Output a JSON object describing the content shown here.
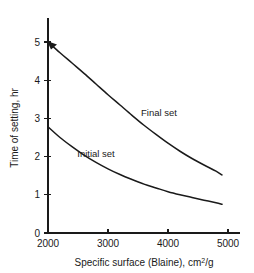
{
  "chart_data": {
    "type": "line",
    "title": "",
    "xlabel": "Specific surface (Blaine), cm²/g",
    "ylabel": "Time of setting, hr",
    "xlim": [
      2000,
      5000
    ],
    "ylim": [
      0,
      5
    ],
    "xticks": [
      2000,
      3000,
      4000,
      5000
    ],
    "xtick_labels": [
      "2000",
      "3000",
      "4000",
      "5000"
    ],
    "yticks": [
      0,
      1,
      2,
      3,
      4,
      5
    ],
    "ytick_labels": [
      "0",
      "1",
      "2",
      "3",
      "4",
      "5"
    ],
    "grid": false,
    "legend_position": "inline-annotations",
    "series": [
      {
        "name": "Final set",
        "label": "Final set",
        "label_x": 3850,
        "label_y": 3.05,
        "x": [
          2000,
          2200,
          2400,
          2600,
          2800,
          3000,
          3200,
          3400,
          3600,
          3800,
          4000,
          4200,
          4400,
          4600,
          4800,
          4900
        ],
        "y": [
          5.0,
          4.72,
          4.45,
          4.18,
          3.9,
          3.62,
          3.35,
          3.08,
          2.82,
          2.58,
          2.35,
          2.14,
          1.95,
          1.78,
          1.62,
          1.52
        ]
      },
      {
        "name": "Initial set",
        "label": "Initial set",
        "label_x": 2800,
        "label_y": 2.0,
        "x": [
          2000,
          2200,
          2400,
          2600,
          2800,
          3000,
          3200,
          3400,
          3600,
          3800,
          4000,
          4200,
          4400,
          4600,
          4800,
          4900
        ],
        "y": [
          2.78,
          2.5,
          2.26,
          2.04,
          1.85,
          1.68,
          1.53,
          1.4,
          1.28,
          1.18,
          1.08,
          1.0,
          0.93,
          0.86,
          0.79,
          0.75
        ]
      }
    ],
    "annotations": [
      {
        "name": "final-set-start-marker",
        "x": 2000,
        "y": 5.0,
        "shape": "arrowhead"
      }
    ]
  },
  "axes": {
    "x_title_text": "Specific surface (Blaine), cm",
    "x_title_sup": "2",
    "x_title_tail": "/g",
    "y_title_text": "Time of setting, hr"
  },
  "colors": {
    "background": "#ffffff",
    "ink": "#1a1a1a",
    "curve": "#1a1a1a"
  }
}
